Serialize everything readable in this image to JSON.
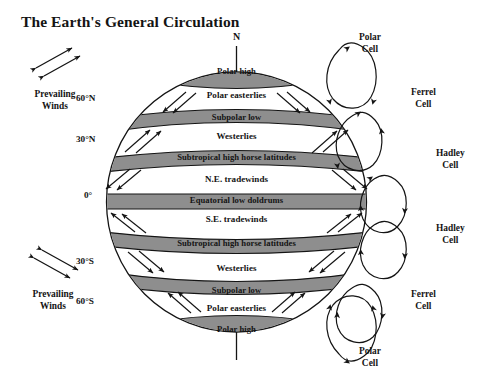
{
  "title": "The Earth's General Circulation",
  "globe": {
    "pole_markers": [
      {
        "name": "north-pole-marker",
        "label": "N"
      }
    ],
    "latitude_labels": [
      {
        "name": "latitude-60n",
        "label": "60°N"
      },
      {
        "name": "latitude-30n",
        "label": "30°N"
      },
      {
        "name": "latitude-0",
        "label": "0°"
      },
      {
        "name": "latitude-30s",
        "label": "30°S"
      },
      {
        "name": "latitude-60s",
        "label": "60°S"
      }
    ],
    "pressure_bands": [
      {
        "name": "band-polar-high-north",
        "label": "Polar high",
        "color": "#8e8e8e"
      },
      {
        "name": "band-subpolar-low-north",
        "label": "Subpolar low",
        "color": "#8e8e8e"
      },
      {
        "name": "band-subtropical-high-north",
        "label": "Subtropical high horse latitudes",
        "color": "#8e8e8e"
      },
      {
        "name": "band-equatorial-low",
        "label": "Equatorial low doldrums",
        "color": "#8e8e8e"
      },
      {
        "name": "band-subtropical-high-south",
        "label": "Subtropical high horse latitudes",
        "color": "#8e8e8e"
      },
      {
        "name": "band-subpolar-low-south",
        "label": "Subpolar low",
        "color": "#8e8e8e"
      },
      {
        "name": "band-polar-high-south",
        "label": "Polar high",
        "color": "#8e8e8e"
      }
    ],
    "wind_zones": [
      {
        "name": "zone-polar-easterlies-north",
        "label": "Polar easterlies"
      },
      {
        "name": "zone-westerlies-north",
        "label": "Westerlies"
      },
      {
        "name": "zone-ne-tradewinds",
        "label": "N.E. tradewinds"
      },
      {
        "name": "zone-se-tradewinds",
        "label": "S.E. tradewinds"
      },
      {
        "name": "zone-westerlies-south",
        "label": "Westerlies"
      },
      {
        "name": "zone-polar-easterlies-south",
        "label": "Polar easterlies"
      }
    ]
  },
  "circulation_cells": [
    {
      "name": "cell-polar-north",
      "line1": "Polar",
      "line2": "Cell"
    },
    {
      "name": "cell-ferrel-north",
      "line1": "Ferrel",
      "line2": "Cell"
    },
    {
      "name": "cell-hadley-north",
      "line1": "Hadley",
      "line2": "Cell"
    },
    {
      "name": "cell-hadley-south",
      "line1": "Hadley",
      "line2": "Cell"
    },
    {
      "name": "cell-ferrel-south",
      "line1": "Ferrel",
      "line2": "Cell"
    },
    {
      "name": "cell-polar-south",
      "line1": "Polar",
      "line2": "Cell"
    }
  ],
  "prevailing_winds": [
    {
      "name": "prevailing-winds-north",
      "line1": "Prevailing",
      "line2": "Winds"
    },
    {
      "name": "prevailing-winds-south",
      "line1": "Prevailing",
      "line2": "Winds"
    }
  ],
  "colors": {
    "ink": "#141414",
    "band_fill": "#8e8e8e",
    "background": "#ffffff"
  }
}
